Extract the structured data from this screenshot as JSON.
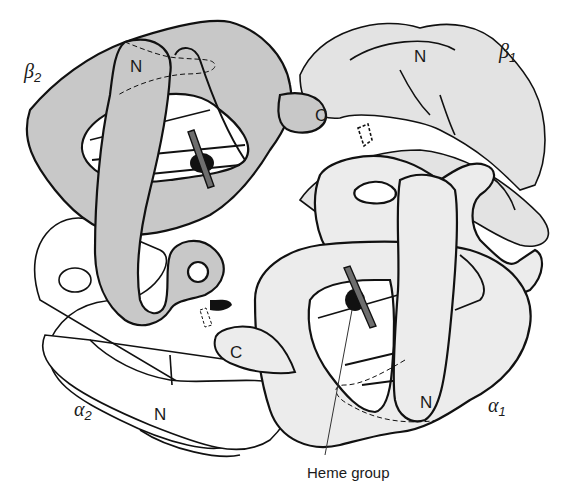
{
  "figure": {
    "subunits": [
      {
        "id": "beta2",
        "label": "β",
        "subscript": "2",
        "terminal_labels": [
          "N",
          "C"
        ],
        "fill": "#c8c8c8"
      },
      {
        "id": "beta1",
        "label": "β",
        "subscript": "1",
        "terminal_labels": [
          "N"
        ],
        "fill": "#e3e3e3"
      },
      {
        "id": "alpha1",
        "label": "α",
        "subscript": "1",
        "terminal_labels": [
          "N"
        ],
        "fill": "#ececec"
      },
      {
        "id": "alpha2",
        "label": "α",
        "subscript": "2",
        "terminal_labels": [
          "N",
          "C"
        ],
        "fill": "#ffffff"
      }
    ],
    "labels": {
      "beta2": {
        "greek": "β",
        "sub": "2"
      },
      "beta1": {
        "greek": "β",
        "sub": "1"
      },
      "alpha1": {
        "greek": "α",
        "sub": "1"
      },
      "alpha2": {
        "greek": "α",
        "sub": "2"
      },
      "beta2_n": "N",
      "beta1_n": "N",
      "beta1_c": "C",
      "alpha1_n": "N",
      "alpha2_n": "N",
      "alpha2_c": "C"
    },
    "callout": "Heme group",
    "colors": {
      "stroke": "#111111",
      "beta2_fill": "#c8c8c8",
      "beta1_fill": "#e3e3e3",
      "alpha1_fill": "#ececec",
      "alpha2_fill": "#ffffff",
      "heme_fill": "#6e6e6e",
      "iron_fill": "#111111"
    }
  }
}
